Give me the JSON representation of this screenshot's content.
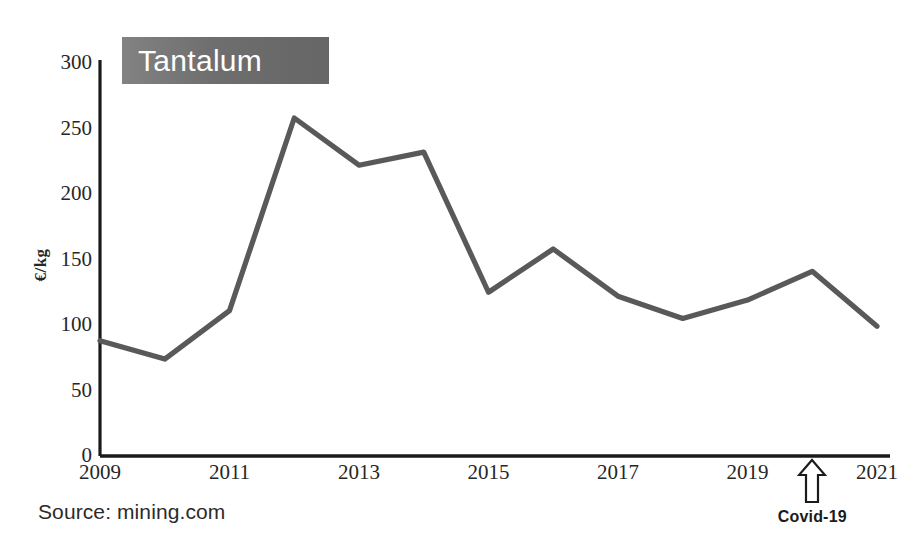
{
  "chart_data": {
    "type": "line",
    "title": "Tantalum",
    "xlabel": "",
    "ylabel": "€/kg",
    "x": [
      2009,
      2010,
      2011,
      2012,
      2013,
      2014,
      2015,
      2016,
      2017,
      2018,
      2019,
      2020,
      2021
    ],
    "values": [
      88,
      74,
      111,
      258,
      222,
      232,
      125,
      158,
      122,
      105,
      119,
      141,
      99
    ],
    "series": [
      {
        "name": "Tantalum price",
        "values": [
          88,
          74,
          111,
          258,
          222,
          232,
          125,
          158,
          122,
          105,
          119,
          141,
          99
        ]
      }
    ],
    "xlim": [
      2009,
      2021
    ],
    "ylim": [
      0,
      300
    ],
    "ytick_labels": [
      "300",
      "250",
      "200",
      "150",
      "100",
      "50",
      "0"
    ],
    "ytick_values": [
      300,
      250,
      200,
      150,
      100,
      50,
      0
    ],
    "xtick_labels": [
      "2009",
      "2011",
      "2013",
      "2015",
      "2017",
      "2019",
      "2021"
    ],
    "xtick_values": [
      2009,
      2011,
      2013,
      2015,
      2017,
      2019,
      2021
    ],
    "grid": false,
    "legend": false,
    "legend_position": "none",
    "line_color": "#595959",
    "annotations": [
      {
        "name": "covid-19",
        "label": "Covid-19",
        "icon": "up-arrow-icon",
        "points_at_x": 2020
      }
    ]
  },
  "figure": {
    "title_badge": {
      "label": "Tantalum",
      "background_color": "#6e6e6e",
      "text_color": "#ffffff"
    },
    "axis_label_y": "€/kg",
    "source_note": "Source: mining.com",
    "annotation_label": "Covid-19",
    "axis_color": "#1a1a1a",
    "background_color": "#ffffff"
  }
}
